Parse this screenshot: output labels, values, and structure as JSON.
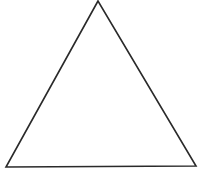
{
  "diagram": {
    "shape": "triangle",
    "stroke_color": "#2a2a2a",
    "fill_color": "#ffffff",
    "background": "#ffffff",
    "vertices": [
      [
        98,
        1
      ],
      [
        6,
        167
      ],
      [
        196,
        166
      ]
    ]
  }
}
